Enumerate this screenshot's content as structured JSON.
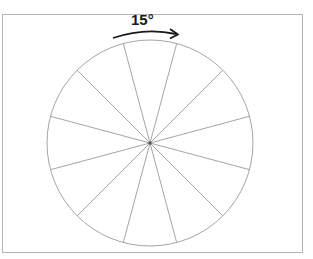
{
  "diagram": {
    "angle_label": "15°",
    "spoke_count": 12,
    "spoke_offset_deg": 15,
    "spoke_step_deg": 30,
    "circle": {
      "cx": 150,
      "cy": 143,
      "r": 103
    },
    "colors": {
      "circle_stroke": "#9a9a9a",
      "spoke_stroke": "#9a9a9a",
      "arrow": "#1a1a1a",
      "frame_border": "#b4b4b4"
    }
  }
}
